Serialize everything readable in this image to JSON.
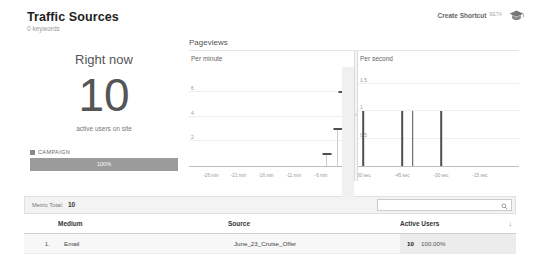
{
  "header": {
    "title": "Traffic Sources",
    "subtitle": "0 keywords",
    "shortcut_label": "Create Shortcut",
    "shortcut_beta": "BETA",
    "cap_icon": "graduation-cap-icon"
  },
  "realtime": {
    "heading": "Right now",
    "count": "10",
    "caption": "active users on site",
    "campaign_title": "CAMPAIGN",
    "campaign_percent": "100%"
  },
  "pageviews": {
    "title": "Pageviews",
    "divider_icon": "›"
  },
  "table": {
    "metric_total_label": "Metric Total:",
    "metric_total_value": "10",
    "search_placeholder": "",
    "search_value": "",
    "search_icon": "search-icon",
    "sort_arrow": "↓",
    "columns": [
      "",
      "Medium",
      "Source",
      "Active Users"
    ],
    "rows": [
      {
        "rank": "1.",
        "medium": "Email",
        "source": "June_23_Cruise_Offer",
        "users": "10",
        "percent": "100.00%"
      }
    ]
  },
  "chart_data": [
    {
      "type": "bar",
      "title": "Per minute",
      "xlabel": "",
      "ylabel": "",
      "ylim": [
        0,
        8
      ],
      "yticks": [
        2,
        4,
        6
      ],
      "ytick_labels": [
        "2",
        "4",
        "6"
      ],
      "xticks": [
        -26,
        -21,
        -16,
        -11,
        -6
      ],
      "xtick_labels": [
        "-26 min",
        "-21 min",
        "-16 min",
        "-11 min",
        "-6 min"
      ],
      "x_range": [
        -30,
        0
      ],
      "grid": true,
      "categories": [
        -30,
        -29,
        -28,
        -27,
        -26,
        -25,
        -24,
        -23,
        -22,
        -21,
        -20,
        -19,
        -18,
        -17,
        -16,
        -15,
        -14,
        -13,
        -12,
        -11,
        -10,
        -9,
        -8,
        -7,
        -6,
        -5,
        -4,
        -3,
        -2,
        -1,
        0
      ],
      "values": [
        0,
        0,
        0,
        0,
        0,
        0,
        0,
        0,
        0,
        0,
        0,
        0,
        0,
        0,
        0,
        0,
        0,
        0,
        0,
        0,
        0,
        0,
        0,
        0,
        0,
        1,
        0,
        3,
        6,
        1,
        0
      ]
    },
    {
      "type": "bar",
      "title": "Per second",
      "xlabel": "",
      "ylabel": "",
      "ylim": [
        0,
        1.8
      ],
      "yticks": [
        0.5,
        1,
        1.5
      ],
      "ytick_labels": [
        "0.5",
        "1",
        "1.5"
      ],
      "xticks": [
        -60,
        -45,
        -30,
        -15
      ],
      "xtick_labels": [
        "-60 sec",
        "-45 sec",
        "-30 sec",
        "-15 sec"
      ],
      "x_range": [
        -62,
        0
      ],
      "grid": true,
      "categories": [
        -60,
        -45,
        -41,
        -30
      ],
      "values": [
        1,
        1,
        1,
        1
      ]
    }
  ]
}
